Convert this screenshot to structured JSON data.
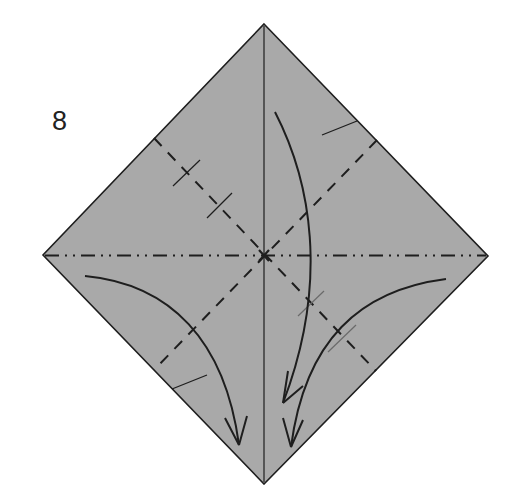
{
  "diagram": {
    "type": "origami-folding-step",
    "step_number": "8",
    "colors": {
      "paper": "#a9a9a9",
      "line": "#1e1e1e",
      "background": "#ffffff"
    },
    "shape": {
      "kind": "square-rotated-45",
      "vertices": {
        "top": [
          264,
          24
        ],
        "right": [
          488,
          256
        ],
        "bottom": [
          264,
          484
        ],
        "left": [
          43,
          255
        ]
      }
    },
    "lines": [
      {
        "name": "vertical-center-line",
        "style": "solid-thin",
        "from": [
          264,
          24
        ],
        "to": [
          264,
          484
        ]
      },
      {
        "name": "horizontal-mountain-fold",
        "style": "dash-dot-dot",
        "from": [
          43,
          255
        ],
        "to": [
          488,
          256
        ]
      },
      {
        "name": "valley-fold-upper-left-lower-right",
        "style": "dashed",
        "from": [
          154,
          138
        ],
        "to": [
          376,
          370
        ]
      },
      {
        "name": "valley-fold-upper-right-lower-left",
        "style": "dashed",
        "from": [
          376,
          140
        ],
        "to": [
          154,
          370
        ]
      }
    ],
    "center_mark": "x-marker",
    "arrows": [
      {
        "name": "arrow-top-to-bottom",
        "direction": "down-curved"
      },
      {
        "name": "arrow-left-to-bottom",
        "direction": "right-down-curved"
      },
      {
        "name": "arrow-right-to-bottom",
        "direction": "left-down-curved"
      }
    ]
  }
}
